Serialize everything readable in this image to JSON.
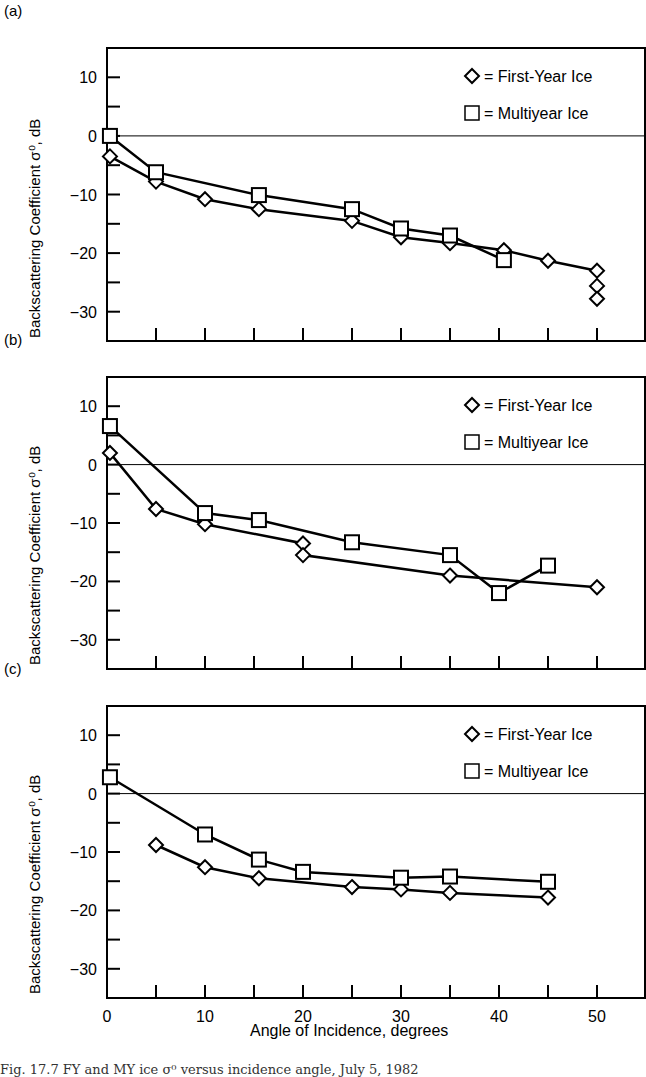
{
  "figure": {
    "xlabel": "Angle of Incidence, degrees",
    "ylabel": "Backscattering Coefficient σ⁰, dB",
    "caption": "Fig. 17.7  FY and MY ice σ⁰ versus incidence angle, July 5, 1982",
    "legend": {
      "fy": "= First-Year Ice",
      "my": "= Multiyear Ice"
    }
  },
  "chart_data": [
    {
      "panel": "(a)",
      "type": "line",
      "xlabel": "Angle of Incidence, degrees",
      "ylabel": "Backscattering Coefficient σ⁰, dB",
      "xlim": [
        0,
        55
      ],
      "ylim": [
        -35,
        15
      ],
      "xticks": [
        0,
        10,
        20,
        30,
        40,
        50
      ],
      "yticks": [
        10,
        0,
        -10,
        -20,
        -30
      ],
      "reference_line_y": 0,
      "legend_position": "top-right",
      "series": [
        {
          "name": "First-Year Ice",
          "marker": "diamond",
          "points": [
            [
              0.3,
              -3.5
            ],
            [
              5,
              -7.8
            ],
            [
              10,
              -10.8
            ],
            [
              15.5,
              -12.5
            ],
            [
              25,
              -14.5
            ],
            [
              30,
              -17.3
            ],
            [
              35,
              -18.3
            ],
            [
              40.5,
              -19.5
            ],
            [
              45,
              -21.3
            ],
            [
              50,
              -23
            ],
            [
              50,
              -25.6
            ],
            [
              50,
              -27.8
            ]
          ]
        },
        {
          "name": "Multiyear Ice",
          "marker": "square",
          "points": [
            [
              0.3,
              0
            ],
            [
              5,
              -6.2
            ],
            [
              15.5,
              -10.1
            ],
            [
              25,
              -12.5
            ],
            [
              30,
              -15.8
            ],
            [
              35,
              -17
            ],
            [
              40.5,
              -21.2
            ]
          ]
        }
      ]
    },
    {
      "panel": "(b)",
      "type": "line",
      "xlabel": "Angle of Incidence, degrees",
      "ylabel": "Backscattering Coefficient σ⁰, dB",
      "xlim": [
        0,
        55
      ],
      "ylim": [
        -35,
        15
      ],
      "xticks": [
        0,
        10,
        20,
        30,
        40,
        50
      ],
      "yticks": [
        10,
        0,
        -10,
        -20,
        -30
      ],
      "reference_line_y": 0,
      "legend_position": "top-right",
      "series": [
        {
          "name": "First-Year Ice",
          "marker": "diamond",
          "points": [
            [
              0.3,
              2
            ],
            [
              5,
              -7.6
            ],
            [
              10,
              -10.2
            ],
            [
              20,
              -13.5
            ],
            [
              20,
              -15.5
            ],
            [
              35,
              -19
            ],
            [
              50,
              -21
            ]
          ]
        },
        {
          "name": "Multiyear Ice",
          "marker": "square",
          "points": [
            [
              0.3,
              6.6
            ],
            [
              10,
              -8.3
            ],
            [
              15.5,
              -9.5
            ],
            [
              25,
              -13.3
            ],
            [
              35,
              -15.5
            ],
            [
              40,
              -22
            ],
            [
              45,
              -17.3
            ]
          ]
        }
      ]
    },
    {
      "panel": "(c)",
      "type": "line",
      "xlabel": "Angle of Incidence, degrees",
      "ylabel": "Backscattering Coefficient σ⁰, dB",
      "xlim": [
        0,
        55
      ],
      "ylim": [
        -35,
        15
      ],
      "xticks": [
        0,
        10,
        20,
        30,
        40,
        50
      ],
      "yticks": [
        10,
        0,
        -10,
        -20,
        -30
      ],
      "reference_line_y": 0,
      "legend_position": "top-right",
      "series": [
        {
          "name": "First-Year Ice",
          "marker": "diamond",
          "points": [
            [
              5,
              -8.8
            ],
            [
              10,
              -12.6
            ],
            [
              15.5,
              -14.5
            ],
            [
              25,
              -16
            ],
            [
              30,
              -16.4
            ],
            [
              35,
              -17
            ],
            [
              45,
              -17.8
            ]
          ]
        },
        {
          "name": "Multiyear Ice",
          "marker": "square",
          "points": [
            [
              0.3,
              2.8
            ],
            [
              10,
              -7
            ],
            [
              15.5,
              -11.3
            ],
            [
              20,
              -13.4
            ],
            [
              30,
              -14.4
            ],
            [
              35,
              -14.2
            ],
            [
              45,
              -15.1
            ]
          ]
        }
      ]
    }
  ]
}
